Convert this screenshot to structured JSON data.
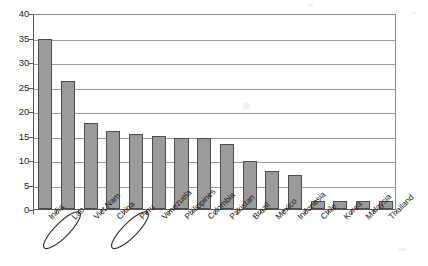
{
  "chart_data": {
    "type": "bar",
    "title": "",
    "subtitle": "",
    "xlabel": "",
    "ylabel": "",
    "categories": [
      "India",
      "Lao",
      "Viet Nam",
      "China",
      "Peru",
      "Venezuela",
      "Philippines",
      "Colombia",
      "Pakistan",
      "Brazil",
      "Mexico",
      "Indonesia",
      "Chile",
      "Korea",
      "Malaysia",
      "Thailand"
    ],
    "values": [
      34.6,
      26.2,
      17.6,
      16.0,
      15.4,
      14.9,
      14.5,
      14.4,
      13.3,
      9.9,
      7.8,
      6.9,
      1.7,
      1.6,
      1.6,
      1.6
    ],
    "ylim": [
      0,
      40
    ],
    "ytick_values": [
      0,
      5,
      10,
      15,
      20,
      25,
      30,
      35,
      40
    ],
    "ytick_labels": [
      "0",
      "5",
      "10",
      "15",
      "20",
      "25",
      "30",
      "35",
      "40"
    ],
    "grid": "horizontal",
    "legend": "none",
    "bar_color": "#9b9b9b",
    "bar_edge_color": "#4d4d4d",
    "gridline_color": "#9c9c9c",
    "axis_color": "#555555",
    "background_color": "#ffffff",
    "annotations": [
      {
        "label": "India",
        "type": "ellipse-circle",
        "category": "India"
      },
      {
        "label": "China",
        "type": "ellipse-circle",
        "category": "China"
      }
    ]
  }
}
